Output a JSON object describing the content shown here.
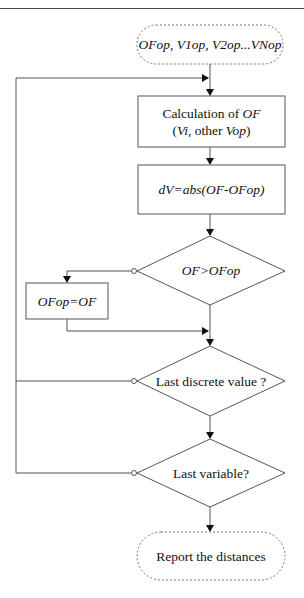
{
  "header": {
    "text": ""
  },
  "flowchart": {
    "start": {
      "text": "OFop, V1op, V2op...VNop"
    },
    "calc_box": {
      "line1": "Calculation  of ",
      "line1_italic": "OF",
      "line2_open": "(",
      "line2_vi": "Vi",
      "line2_mid": ", other ",
      "line2_vop": "Vop",
      "line2_close": ")"
    },
    "dv_box": {
      "text": "dV=abs(OF-OFop)"
    },
    "decision_of": {
      "text": "OF>OFop"
    },
    "update_box": {
      "text": "OFop=OF"
    },
    "decision_discrete": {
      "text": "Last discrete value ?"
    },
    "decision_variable": {
      "text": "Last variable?"
    },
    "end": {
      "text": "Report the distances"
    }
  },
  "colors": {
    "stroke": "#555555",
    "arrow": "#111111",
    "dashed": "#777777"
  }
}
